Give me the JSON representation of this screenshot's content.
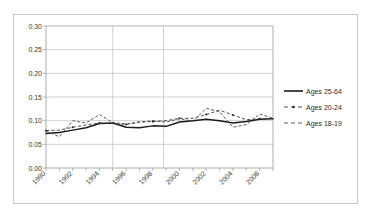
{
  "chart_data": {
    "type": "line",
    "title": "",
    "xlabel": "",
    "ylabel": "",
    "xlim": [
      1990,
      2007
    ],
    "ylim": [
      0.0,
      0.3
    ],
    "grid": true,
    "legend_position": "right",
    "y_ticks": [
      "0.00",
      "0.05",
      "0.10",
      "0.15",
      "0.20",
      "0.25",
      "0.30"
    ],
    "y_tick_values": [
      0.0,
      0.05,
      0.1,
      0.15,
      0.2,
      0.25,
      0.3
    ],
    "x_ticks": [
      "1990",
      "1992",
      "1994",
      "1996",
      "1998",
      "2000",
      "2002",
      "2004",
      "2006"
    ],
    "x_tick_values": [
      1990,
      1992,
      1994,
      1996,
      1998,
      2000,
      2002,
      2004,
      2006
    ],
    "x": [
      1990,
      1991,
      1992,
      1993,
      1994,
      1995,
      1996,
      1997,
      1998,
      1999,
      2000,
      2001,
      2002,
      2003,
      2004,
      2005,
      2006,
      2007
    ],
    "series": [
      {
        "name": "Ages 25-64",
        "style": "solid",
        "marker": "none",
        "color": "#1b1b1b",
        "values": [
          0.073,
          0.075,
          0.08,
          0.085,
          0.094,
          0.095,
          0.086,
          0.085,
          0.089,
          0.088,
          0.097,
          0.1,
          0.103,
          0.1,
          0.095,
          0.098,
          0.103,
          0.104
        ]
      },
      {
        "name": "Ages 20-24",
        "style": "dashed-marker",
        "marker": "diamond",
        "color": "#3d3d3d",
        "values": [
          0.079,
          0.08,
          0.086,
          0.091,
          0.095,
          0.094,
          0.092,
          0.098,
          0.098,
          0.1,
          0.105,
          0.105,
          0.113,
          0.122,
          0.112,
          0.102,
          0.104,
          0.105
        ]
      },
      {
        "name": "Ages 18-19",
        "style": "dashed",
        "marker": "none",
        "color": "#4a4a4a",
        "values": [
          0.078,
          0.066,
          0.1,
          0.095,
          0.113,
          0.096,
          0.093,
          0.096,
          0.1,
          0.097,
          0.104,
          0.099,
          0.126,
          0.119,
          0.086,
          0.092,
          0.114,
          0.105
        ]
      }
    ]
  },
  "legend": {
    "items": [
      {
        "label": "Ages 25-64"
      },
      {
        "label": "Ages 20-24"
      },
      {
        "label": "Ages 18-19"
      }
    ]
  }
}
